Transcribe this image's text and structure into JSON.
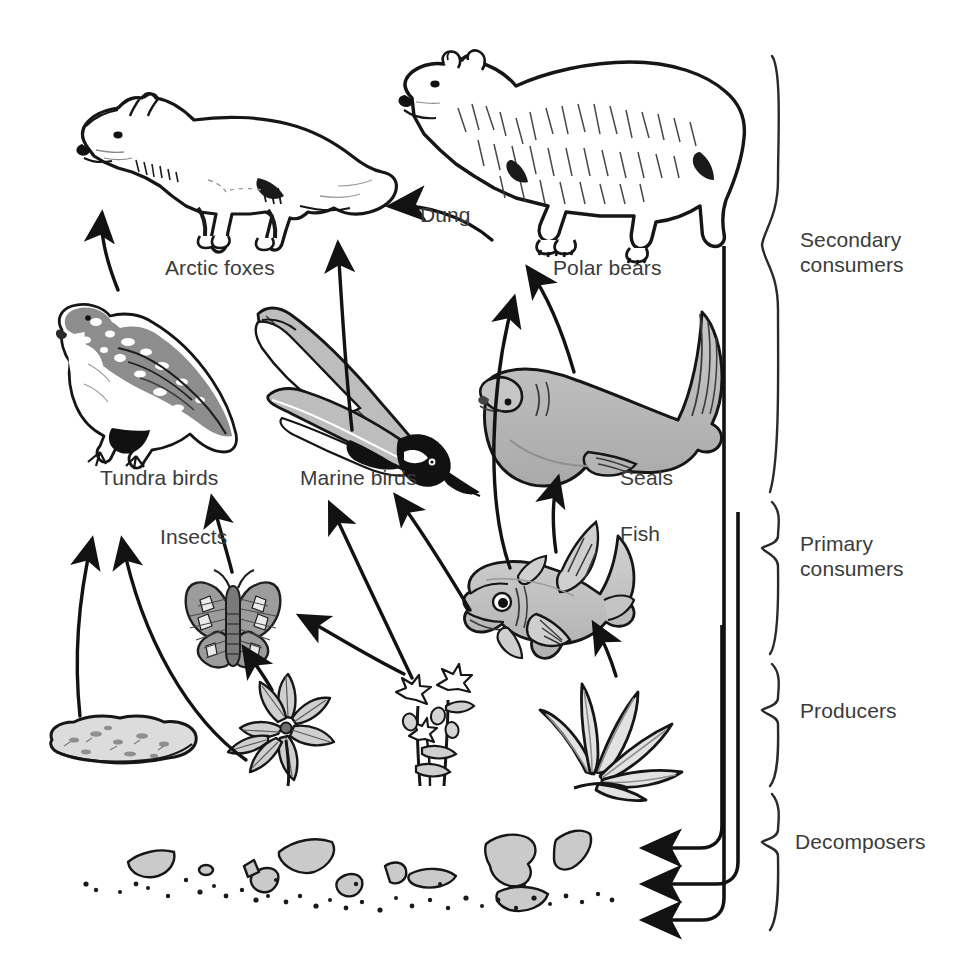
{
  "diagram": {
    "background_color": "#ffffff",
    "ink_color": "#1a1a1a",
    "label_color": "#3b3b3b",
    "fill_gray": "#b9b9b9",
    "fill_light": "#d8d8d8"
  },
  "organisms": [
    {
      "id": "arctic-foxes",
      "label": "Arctic foxes",
      "label_x": 165,
      "label_y": 267,
      "tier": "secondary-consumers"
    },
    {
      "id": "polar-bears",
      "label": "Polar bears",
      "label_x": 553,
      "label_y": 267,
      "tier": "secondary-consumers"
    },
    {
      "id": "tundra-birds",
      "label": "Tundra birds",
      "label_x": 100,
      "label_y": 476,
      "tier": "secondary-consumers"
    },
    {
      "id": "marine-birds",
      "label": "Marine birds",
      "label_x": 300,
      "label_y": 476,
      "tier": "secondary-consumers"
    },
    {
      "id": "seals",
      "label": "Seals",
      "label_x": 620,
      "label_y": 476,
      "tier": "secondary-consumers"
    },
    {
      "id": "insects",
      "label": "Insects",
      "label_x": 160,
      "label_y": 535,
      "tier": "primary-consumers"
    },
    {
      "id": "fish",
      "label": "Fish",
      "label_x": 620,
      "label_y": 532,
      "tier": "primary-consumers"
    }
  ],
  "flow_labels": [
    {
      "id": "dung",
      "label": "Dung",
      "label_x": 420,
      "label_y": 213
    }
  ],
  "tiers": [
    {
      "id": "secondary-consumers",
      "label": "Secondary\nconsumers",
      "label_x": 808,
      "label_y": 245,
      "brace_top": 55,
      "brace_bottom": 492
    },
    {
      "id": "primary-consumers",
      "label": "Primary\nconsumers",
      "label_x": 808,
      "label_y": 548,
      "brace_top": 500,
      "brace_bottom": 655
    },
    {
      "id": "producers",
      "label": "Producers",
      "label_x": 808,
      "label_y": 709,
      "brace_top": 662,
      "brace_bottom": 785
    },
    {
      "id": "decomposers",
      "label": "Decomposers",
      "label_x": 800,
      "label_y": 840,
      "brace_top": 792,
      "brace_bottom": 930
    }
  ],
  "arrows": [
    {
      "id": "lichen-to-tundra-birds",
      "from": "lichen",
      "to": "tundra-birds"
    },
    {
      "id": "cushion-plant-to-tundra-birds",
      "from": "cushion-plant",
      "to": "tundra-birds"
    },
    {
      "id": "cushion-plant-to-insects",
      "from": "cushion-plant",
      "to": "insects"
    },
    {
      "id": "flowering-plant-to-insects",
      "from": "flowering-plant",
      "to": "insects"
    },
    {
      "id": "insects-to-tundra-birds",
      "from": "insects",
      "to": "tundra-birds"
    },
    {
      "id": "flowering-plant-to-marine-birds",
      "from": "flowering-plant",
      "to": "marine-birds"
    },
    {
      "id": "fish-to-marine-birds",
      "from": "fish",
      "to": "marine-birds"
    },
    {
      "id": "seaweed-to-fish",
      "from": "seaweed",
      "to": "fish"
    },
    {
      "id": "fish-to-seals",
      "from": "fish",
      "to": "seals"
    },
    {
      "id": "fish-to-polar-bears",
      "from": "fish",
      "to": "polar-bears"
    },
    {
      "id": "marine-birds-to-arctic-foxes",
      "from": "marine-birds",
      "to": "arctic-foxes"
    },
    {
      "id": "tundra-birds-to-arctic-foxes",
      "from": "tundra-birds",
      "to": "arctic-foxes"
    },
    {
      "id": "seals-to-polar-bears",
      "from": "seals",
      "to": "polar-bears"
    },
    {
      "id": "polar-bears-dung-to-arctic-foxes",
      "from": "polar-bears",
      "to": "arctic-foxes",
      "label": "Dung"
    },
    {
      "id": "secondary-consumers-to-decomposers",
      "from": "secondary-consumers",
      "to": "decomposers"
    },
    {
      "id": "primary-consumers-to-decomposers",
      "from": "primary-consumers",
      "to": "decomposers"
    },
    {
      "id": "producers-to-decomposers",
      "from": "producers",
      "to": "decomposers"
    }
  ]
}
